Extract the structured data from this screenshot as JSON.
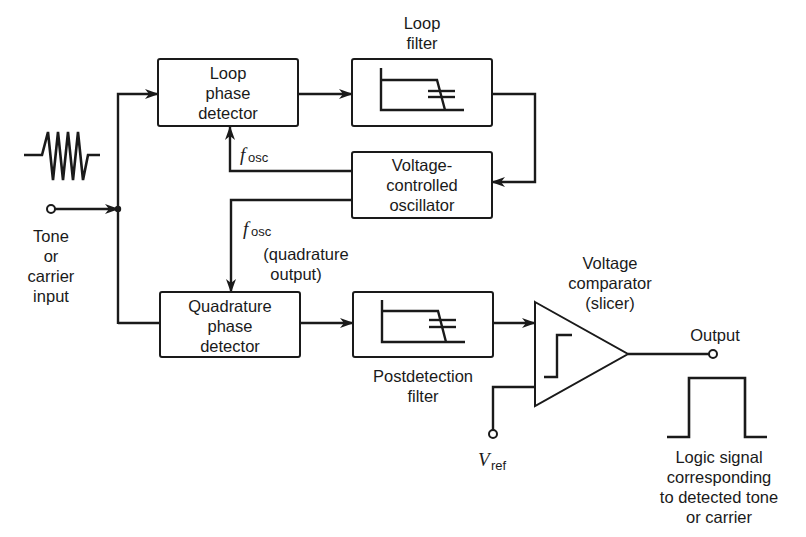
{
  "diagram": {
    "type": "block-diagram",
    "colors": {
      "line": "#1a1a1a",
      "background": "#ffffff"
    },
    "input": {
      "label_lines": [
        "Tone",
        "or",
        "carrier",
        "input"
      ],
      "waveform_icon": "burst-sine-icon"
    },
    "blocks": {
      "loop_phase_detector": {
        "lines": [
          "Loop",
          "phase",
          "detector"
        ]
      },
      "loop_filter": {
        "label_lines": [
          "Loop",
          "filter"
        ],
        "icon": "lowpass-filter-icon"
      },
      "vco": {
        "lines": [
          "Voltage-",
          "controlled",
          "oscillator"
        ]
      },
      "quadrature_phase_detector": {
        "lines": [
          "Quadrature",
          "phase",
          "detector"
        ]
      },
      "postdetection_filter": {
        "label_lines": [
          "Postdetection",
          "filter"
        ],
        "icon": "lowpass-filter-icon"
      },
      "comparator": {
        "label_lines": [
          "Voltage",
          "comparator",
          "(slicer)"
        ],
        "icon": "step-icon"
      }
    },
    "signals": {
      "fosc_main": "f",
      "fosc_sub": "osc",
      "fosc_quad": "f",
      "fosc_quad_sub": "osc",
      "quad_note_lines": [
        "(quadrature",
        "output)"
      ],
      "vref": "V",
      "vref_sub": "ref"
    },
    "output": {
      "label": "Output",
      "logic_label_lines": [
        "Logic signal",
        "corresponding",
        "to detected tone",
        "or carrier"
      ],
      "waveform_icon": "pulse-icon"
    },
    "connections": [
      [
        "input",
        "junction"
      ],
      [
        "junction",
        "loop_phase_detector"
      ],
      [
        "junction",
        "quadrature_phase_detector"
      ],
      [
        "loop_phase_detector",
        "loop_filter"
      ],
      [
        "loop_filter",
        "vco"
      ],
      [
        "vco",
        "loop_phase_detector"
      ],
      [
        "vco",
        "quadrature_phase_detector"
      ],
      [
        "quadrature_phase_detector",
        "postdetection_filter"
      ],
      [
        "postdetection_filter",
        "comparator"
      ],
      [
        "vref",
        "comparator"
      ],
      [
        "comparator",
        "output"
      ]
    ]
  }
}
